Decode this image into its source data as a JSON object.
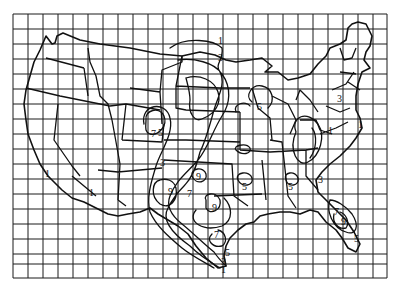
{
  "map": {
    "title": "",
    "region": "Contiguous United States",
    "grid": {
      "x0": 13,
      "y0": 14,
      "x1": 387,
      "y1": 278,
      "columns": 25,
      "rows": 18
    },
    "contour_levels": [
      "1",
      "3",
      "5",
      "7",
      "9"
    ],
    "labels": [
      {
        "text": "1",
        "x": 218,
        "y": 44
      },
      {
        "text": "3",
        "x": 218,
        "y": 61
      },
      {
        "text": "5",
        "x": 260,
        "y": 106
      },
      {
        "text": "3",
        "x": 340,
        "y": 100
      },
      {
        "text": "1",
        "x": 331,
        "y": 132
      },
      {
        "text": "1",
        "x": 360,
        "y": 126
      },
      {
        "text": "7",
        "x": 153,
        "y": 135
      },
      {
        "text": "5",
        "x": 161,
        "y": 135
      },
      {
        "text": "3",
        "x": 163,
        "y": 164
      },
      {
        "text": "1",
        "x": 45,
        "y": 175
      },
      {
        "text": "1",
        "x": 91,
        "y": 193
      },
      {
        "text": "5",
        "x": 244,
        "y": 188
      },
      {
        "text": "5",
        "x": 289,
        "y": 188
      },
      {
        "text": "3",
        "x": 320,
        "y": 181
      },
      {
        "text": "9",
        "x": 170,
        "y": 193
      },
      {
        "text": "9",
        "x": 197,
        "y": 181
      },
      {
        "text": "7",
        "x": 189,
        "y": 196
      },
      {
        "text": "9",
        "x": 213,
        "y": 209
      },
      {
        "text": "7",
        "x": 217,
        "y": 236
      },
      {
        "text": "5",
        "x": 227,
        "y": 255
      },
      {
        "text": "3",
        "x": 222,
        "y": 264
      },
      {
        "text": "1",
        "x": 222,
        "y": 273
      },
      {
        "text": "7",
        "x": 335,
        "y": 214
      },
      {
        "text": "9",
        "x": 343,
        "y": 224
      },
      {
        "text": "5",
        "x": 356,
        "y": 240
      }
    ]
  }
}
